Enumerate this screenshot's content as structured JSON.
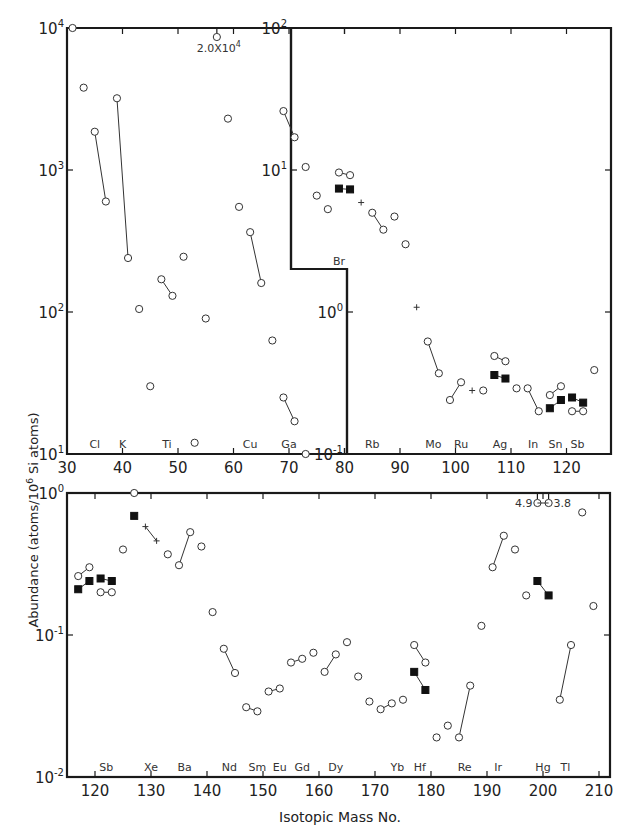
{
  "chart_data": {
    "type": "scatter",
    "title": "",
    "ylabel": "Abundance (atoms/10^6 Si atoms)",
    "xlabel": "Isotopic Mass No.",
    "yscale": "log",
    "grid": false,
    "legend": null,
    "marker_types": {
      "open": "open circle",
      "filled": "filled square",
      "plus": "cross"
    },
    "panels": [
      {
        "name": "top-left",
        "xlim": [
          30,
          80
        ],
        "ylim": [
          10,
          10000
        ],
        "xticks": [
          30,
          40,
          50,
          60,
          70,
          80
        ],
        "yticks": [
          "10^1",
          "10^2",
          "10^3",
          "10^4"
        ],
        "element_labels": [
          {
            "m": 35,
            "t": "Cl"
          },
          {
            "m": 40,
            "t": "K"
          },
          {
            "m": 48,
            "t": "Ti"
          },
          {
            "m": 63,
            "t": "Cu"
          },
          {
            "m": 70,
            "t": "Ga"
          }
        ],
        "annotations": [
          {
            "m": 57,
            "v": 20000,
            "text": "2.0X10^4"
          }
        ],
        "series": [
          {
            "marker": "open",
            "points": [
              [
                31,
                10000
              ]
            ]
          },
          {
            "marker": "open",
            "points": [
              [
                33,
                3800
              ]
            ]
          },
          {
            "marker": "open",
            "points": [
              [
                35,
                1860
              ],
              [
                37,
                600
              ]
            ]
          },
          {
            "marker": "open",
            "points": [
              [
                39,
                3200
              ],
              [
                41,
                240
              ]
            ]
          },
          {
            "marker": "open",
            "points": [
              [
                43,
                105
              ]
            ]
          },
          {
            "marker": "open",
            "points": [
              [
                45,
                30
              ]
            ]
          },
          {
            "marker": "open",
            "points": [
              [
                47,
                170
              ],
              [
                49,
                130
              ]
            ]
          },
          {
            "marker": "open",
            "points": [
              [
                51,
                245
              ]
            ]
          },
          {
            "marker": "open",
            "points": [
              [
                53,
                12
              ]
            ]
          },
          {
            "marker": "open",
            "points": [
              [
                55,
                90
              ]
            ]
          },
          {
            "marker": "open",
            "points": [
              [
                59,
                2300
              ]
            ]
          },
          {
            "marker": "open",
            "points": [
              [
                61,
                550
              ]
            ]
          },
          {
            "marker": "open",
            "points": [
              [
                63,
                365
              ],
              [
                65,
                160
              ]
            ]
          },
          {
            "marker": "open",
            "points": [
              [
                67,
                63
              ]
            ]
          },
          {
            "marker": "open",
            "points": [
              [
                69,
                25
              ],
              [
                71,
                17
              ]
            ]
          },
          {
            "marker": "open",
            "points": [
              [
                73,
                10
              ]
            ]
          }
        ]
      },
      {
        "name": "top-right",
        "xlim": [
          80,
          126
        ],
        "ylim": [
          0.1,
          100
        ],
        "xticks": [
          80,
          90,
          100,
          110,
          120
        ],
        "yticks": [
          "10^-1",
          "10^0",
          "10^1",
          "10^2"
        ],
        "element_labels": [
          {
            "m": 79,
            "t": "Br"
          },
          {
            "m": 85,
            "t": "Rb"
          },
          {
            "m": 96,
            "t": "Mo"
          },
          {
            "m": 101,
            "t": "Ru"
          },
          {
            "m": 108,
            "t": "Ag"
          },
          {
            "m": 114,
            "t": "In"
          },
          {
            "m": 118,
            "t": "Sn"
          },
          {
            "m": 122,
            "t": "Sb"
          }
        ],
        "series": [
          {
            "marker": "open",
            "points": [
              [
                69,
                26
              ],
              [
                71,
                17
              ]
            ]
          },
          {
            "marker": "open",
            "points": [
              [
                73,
                10.5
              ]
            ]
          },
          {
            "marker": "open",
            "points": [
              [
                75,
                6.6
              ]
            ]
          },
          {
            "marker": "open",
            "points": [
              [
                77,
                5.3
              ]
            ]
          },
          {
            "marker": "open",
            "points": [
              [
                79,
                9.6
              ],
              [
                81,
                9.2
              ]
            ]
          },
          {
            "marker": "filled",
            "points": [
              [
                79,
                7.4
              ],
              [
                81,
                7.3
              ]
            ]
          },
          {
            "marker": "plus",
            "points": [
              [
                83,
                5.9
              ]
            ]
          },
          {
            "marker": "open",
            "points": [
              [
                85,
                5.0
              ],
              [
                87,
                3.8
              ]
            ]
          },
          {
            "marker": "open",
            "points": [
              [
                89,
                4.7
              ]
            ]
          },
          {
            "marker": "open",
            "points": [
              [
                91,
                3.0
              ]
            ]
          },
          {
            "marker": "plus",
            "points": [
              [
                93,
                1.08
              ]
            ]
          },
          {
            "marker": "open",
            "points": [
              [
                95,
                0.62
              ],
              [
                97,
                0.37
              ]
            ]
          },
          {
            "marker": "open",
            "points": [
              [
                99,
                0.24
              ],
              [
                101,
                0.32
              ]
            ]
          },
          {
            "marker": "plus",
            "points": [
              [
                103,
                0.28
              ]
            ]
          },
          {
            "marker": "open",
            "points": [
              [
                105,
                0.28
              ]
            ]
          },
          {
            "marker": "open",
            "points": [
              [
                107,
                0.49
              ],
              [
                109,
                0.45
              ]
            ]
          },
          {
            "marker": "filled",
            "points": [
              [
                107,
                0.36
              ],
              [
                109,
                0.34
              ]
            ]
          },
          {
            "marker": "open",
            "points": [
              [
                111,
                0.29
              ]
            ]
          },
          {
            "marker": "open",
            "points": [
              [
                113,
                0.29
              ],
              [
                115,
                0.2
              ]
            ]
          },
          {
            "marker": "open",
            "points": [
              [
                117,
                0.26
              ],
              [
                119,
                0.3
              ]
            ]
          },
          {
            "marker": "filled",
            "points": [
              [
                117,
                0.21
              ],
              [
                119,
                0.24
              ]
            ]
          },
          {
            "marker": "filled",
            "points": [
              [
                121,
                0.25
              ],
              [
                123,
                0.23
              ]
            ]
          },
          {
            "marker": "open",
            "points": [
              [
                121,
                0.2
              ],
              [
                123,
                0.2
              ]
            ]
          },
          {
            "marker": "open",
            "points": [
              [
                125,
                0.39
              ]
            ]
          }
        ]
      },
      {
        "name": "bottom",
        "xlim": [
          116,
          212
        ],
        "ylim": [
          0.01,
          1
        ],
        "xticks": [
          120,
          130,
          140,
          150,
          160,
          170,
          180,
          190,
          200,
          210
        ],
        "yticks": [
          "10^-2",
          "10^-1",
          "10^0"
        ],
        "element_labels": [
          {
            "m": 122,
            "t": "Sb"
          },
          {
            "m": 130,
            "t": "Xe"
          },
          {
            "m": 136,
            "t": "Ba"
          },
          {
            "m": 144,
            "t": "Nd"
          },
          {
            "m": 149,
            "t": "Sm"
          },
          {
            "m": 153,
            "t": "Eu"
          },
          {
            "m": 157,
            "t": "Gd"
          },
          {
            "m": 163,
            "t": "Dy"
          },
          {
            "m": 174,
            "t": "Yb"
          },
          {
            "m": 178,
            "t": "Hf"
          },
          {
            "m": 186,
            "t": "Re"
          },
          {
            "m": 192,
            "t": "Ir"
          },
          {
            "m": 200,
            "t": "Hg"
          },
          {
            "m": 204,
            "t": "Tl"
          }
        ],
        "annotations": [
          {
            "m": 199,
            "v": 4.9,
            "text": "4.9"
          },
          {
            "m": 201,
            "v": 3.8,
            "text": "3.8"
          }
        ],
        "series": [
          {
            "marker": "open",
            "points": [
              [
                117,
                0.26
              ],
              [
                119,
                0.3
              ]
            ]
          },
          {
            "marker": "filled",
            "points": [
              [
                117,
                0.21
              ],
              [
                119,
                0.24
              ]
            ]
          },
          {
            "marker": "filled",
            "points": [
              [
                121,
                0.25
              ],
              [
                123,
                0.24
              ]
            ]
          },
          {
            "marker": "open",
            "points": [
              [
                121,
                0.2
              ],
              [
                123,
                0.2
              ]
            ]
          },
          {
            "marker": "open",
            "points": [
              [
                125,
                0.4
              ]
            ]
          },
          {
            "marker": "open",
            "points": [
              [
                127,
                1.0
              ]
            ]
          },
          {
            "marker": "filled",
            "points": [
              [
                127,
                0.69
              ]
            ]
          },
          {
            "marker": "plus",
            "points": [
              [
                129,
                0.58
              ],
              [
                131,
                0.46
              ]
            ]
          },
          {
            "marker": "open",
            "points": [
              [
                133,
                0.37
              ]
            ]
          },
          {
            "marker": "open",
            "points": [
              [
                135,
                0.31
              ],
              [
                137,
                0.53
              ]
            ]
          },
          {
            "marker": "open",
            "points": [
              [
                139,
                0.42
              ]
            ]
          },
          {
            "marker": "open",
            "points": [
              [
                141,
                0.145
              ]
            ]
          },
          {
            "marker": "open",
            "points": [
              [
                143,
                0.08
              ],
              [
                145,
                0.054
              ]
            ]
          },
          {
            "marker": "open",
            "points": [
              [
                147,
                0.031
              ],
              [
                149,
                0.029
              ]
            ]
          },
          {
            "marker": "open",
            "points": [
              [
                151,
                0.04
              ],
              [
                153,
                0.042
              ]
            ]
          },
          {
            "marker": "open",
            "points": [
              [
                155,
                0.064
              ],
              [
                157,
                0.068
              ]
            ]
          },
          {
            "marker": "open",
            "points": [
              [
                159,
                0.075
              ]
            ]
          },
          {
            "marker": "open",
            "points": [
              [
                161,
                0.055
              ],
              [
                163,
                0.073
              ]
            ]
          },
          {
            "marker": "open",
            "points": [
              [
                165,
                0.089
              ]
            ]
          },
          {
            "marker": "open",
            "points": [
              [
                167,
                0.051
              ]
            ]
          },
          {
            "marker": "open",
            "points": [
              [
                169,
                0.034
              ]
            ]
          },
          {
            "marker": "open",
            "points": [
              [
                171,
                0.03
              ],
              [
                173,
                0.033
              ]
            ]
          },
          {
            "marker": "open",
            "points": [
              [
                175,
                0.035
              ]
            ]
          },
          {
            "marker": "open",
            "points": [
              [
                177,
                0.085
              ],
              [
                179,
                0.064
              ]
            ]
          },
          {
            "marker": "filled",
            "points": [
              [
                177,
                0.055
              ],
              [
                179,
                0.041
              ]
            ]
          },
          {
            "marker": "open",
            "points": [
              [
                181,
                0.019
              ]
            ]
          },
          {
            "marker": "open",
            "points": [
              [
                183,
                0.023
              ]
            ]
          },
          {
            "marker": "open",
            "points": [
              [
                185,
                0.019
              ],
              [
                187,
                0.044
              ]
            ]
          },
          {
            "marker": "open",
            "points": [
              [
                189,
                0.116
              ]
            ]
          },
          {
            "marker": "open",
            "points": [
              [
                191,
                0.3
              ],
              [
                193,
                0.5
              ]
            ]
          },
          {
            "marker": "open",
            "points": [
              [
                195,
                0.4
              ]
            ]
          },
          {
            "marker": "open",
            "points": [
              [
                197,
                0.19
              ]
            ]
          },
          {
            "marker": "filled",
            "points": [
              [
                199,
                0.24
              ],
              [
                201,
                0.19
              ]
            ]
          },
          {
            "marker": "open",
            "points": [
              [
                203,
                0.035
              ],
              [
                205,
                0.085
              ]
            ]
          },
          {
            "marker": "open",
            "points": [
              [
                207,
                0.73
              ]
            ]
          },
          {
            "marker": "open",
            "points": [
              [
                209,
                0.16
              ]
            ]
          }
        ]
      }
    ]
  },
  "labels": {
    "ylabel": "Abundance (atoms/10",
    "ylabel_sup": "6",
    "ylabel_tail": " Si atoms)",
    "xlabel": "Isotopic Mass No."
  }
}
